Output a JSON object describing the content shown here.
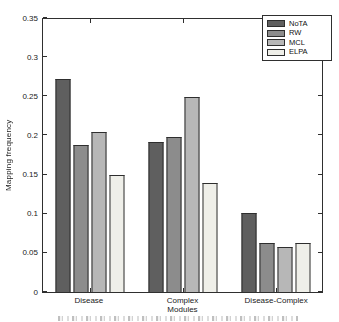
{
  "chart_data": {
    "type": "bar",
    "title": "",
    "xlabel": "",
    "ylabel": "Mapping frequency",
    "categories": [
      "Disease",
      "Complex\nModules",
      "Disease-Complex"
    ],
    "series": [
      {
        "name": "NoTA",
        "color": "#5f5f5f",
        "values": [
          0.272,
          0.192,
          0.101
        ]
      },
      {
        "name": "RW",
        "color": "#8c8c8c",
        "values": [
          0.188,
          0.198,
          0.063
        ]
      },
      {
        "name": "MCL",
        "color": "#b7b7b7",
        "values": [
          0.205,
          0.249,
          0.057
        ]
      },
      {
        "name": "ELPA",
        "color": "#efefe9",
        "values": [
          0.149,
          0.139,
          0.062
        ]
      }
    ],
    "ylim": [
      0,
      0.35
    ],
    "ytick_labels": [
      "0",
      "0.05",
      "0.1",
      "0.15",
      "0.2",
      "0.25",
      "0.3",
      "0.35"
    ],
    "legend_position": "top-right",
    "grid": false,
    "frame_color": "#2f2f2f",
    "background_color": "#ffffff"
  }
}
